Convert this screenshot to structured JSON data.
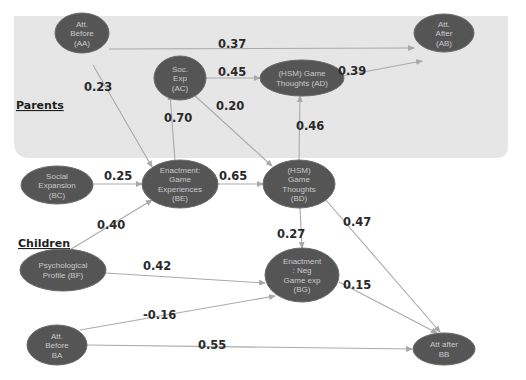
{
  "colors": {
    "node_fill": "#555555",
    "node_text": "#c9c9c9",
    "edge": "#a9a9a9",
    "parents_region": "#e6e6e6",
    "label_text": "#2a2a2a"
  },
  "groups": {
    "parents": {
      "label": "Parents"
    },
    "children": {
      "label": "Children"
    }
  },
  "nodes": [
    {
      "id": "AA",
      "group": "parents",
      "lines": [
        "Att.",
        "Before",
        "(AA)"
      ]
    },
    {
      "id": "AC",
      "group": "parents",
      "lines": [
        "Soc.",
        "Exp",
        "(AC)"
      ]
    },
    {
      "id": "AD",
      "group": "parents",
      "lines": [
        "(HSM) Game",
        "Thoughts (AD)"
      ]
    },
    {
      "id": "AB",
      "group": "parents",
      "lines": [
        "Att.",
        "After",
        "(AB)"
      ]
    },
    {
      "id": "BC",
      "group": "children",
      "lines": [
        "Social",
        "Expansion",
        "(BC)"
      ]
    },
    {
      "id": "BE",
      "group": "children",
      "lines": [
        "Enactment:",
        "Game",
        "Experiences",
        "(BE)"
      ]
    },
    {
      "id": "BD",
      "group": "children",
      "lines": [
        "(HSM)",
        "Game",
        "Thoughts",
        "(BD)"
      ]
    },
    {
      "id": "BF",
      "group": "children",
      "lines": [
        "Psychological",
        "Profile  (BF)"
      ]
    },
    {
      "id": "BG",
      "group": "children",
      "lines": [
        "Enactment",
        ": Neg",
        "Game exp",
        "(BG)"
      ]
    },
    {
      "id": "BA",
      "group": "children",
      "lines": [
        "Att.",
        "Before",
        "BA"
      ]
    },
    {
      "id": "BB",
      "group": "children",
      "lines": [
        "Att after",
        "BB"
      ]
    }
  ],
  "edges": [
    {
      "from": "AA",
      "to": "AB",
      "label": "0.37"
    },
    {
      "from": "AA",
      "to": "BE",
      "label": "0.23"
    },
    {
      "from": "AC",
      "to": "AD",
      "label": "0.45"
    },
    {
      "from": "AC",
      "to": "BD",
      "label": "0.20"
    },
    {
      "from": "AD",
      "to": "AB",
      "label": "0.39"
    },
    {
      "from": "BE",
      "to": "AC",
      "label": "0.70"
    },
    {
      "from": "BD",
      "to": "AD",
      "label": "0.46"
    },
    {
      "from": "BC",
      "to": "BE",
      "label": "0.25"
    },
    {
      "from": "BE",
      "to": "BD",
      "label": "0.65"
    },
    {
      "from": "BF",
      "to": "BE",
      "label": "0.40"
    },
    {
      "from": "BD",
      "to": "BG",
      "label": "0.27"
    },
    {
      "from": "BD",
      "to": "BB",
      "label": "0.47"
    },
    {
      "from": "BF",
      "to": "BG",
      "label": "0.42"
    },
    {
      "from": "BA",
      "to": "BG",
      "label": "-0.16"
    },
    {
      "from": "BG",
      "to": "BB",
      "label": "0.15"
    },
    {
      "from": "BA",
      "to": "BB",
      "label": "0.55"
    }
  ]
}
